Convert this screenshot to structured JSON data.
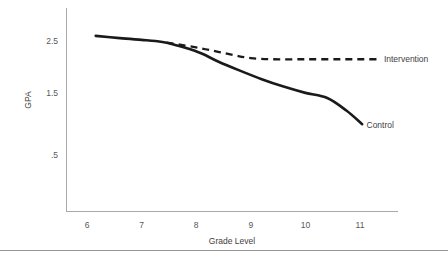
{
  "chart_data": {
    "type": "line",
    "title": "",
    "subtitle": "",
    "xlabel": "Grade Level",
    "ylabel": "GPA",
    "xlim": [
      5.6,
      11.7
    ],
    "ylim": [
      0.0,
      3.0
    ],
    "xticks": [
      "6",
      "7",
      "8",
      "9",
      "10",
      "11"
    ],
    "xtick_values": [
      6,
      7,
      8,
      9,
      10,
      11
    ],
    "yticks": [
      "2.5",
      "1.5",
      ".5"
    ],
    "ytick_values": [
      2.5,
      1.5,
      0.5
    ],
    "grid": false,
    "legend_position": "right-inline-labels",
    "series": [
      {
        "name": "Control",
        "style": "solid",
        "label": "Control",
        "label_x": 11.1,
        "label_y": 1.02,
        "x": [
          6.16,
          6.6,
          7.0,
          7.25,
          7.46,
          7.8,
          8.1,
          8.4,
          8.8,
          9.2,
          9.6,
          10.0,
          10.4,
          10.75,
          11.04
        ],
        "y": [
          2.59,
          2.55,
          2.52,
          2.5,
          2.47,
          2.38,
          2.28,
          2.14,
          1.98,
          1.83,
          1.7,
          1.59,
          1.5,
          1.28,
          1.04
        ]
      },
      {
        "name": "Intervention",
        "style": "dashed",
        "label": "Intervention",
        "label_x": 11.42,
        "label_y": 2.18,
        "x": [
          7.46,
          7.8,
          8.1,
          8.4,
          8.7,
          9.0,
          9.4,
          10.0,
          10.6,
          11.0,
          11.32
        ],
        "y": [
          2.47,
          2.42,
          2.37,
          2.31,
          2.25,
          2.2,
          2.18,
          2.18,
          2.18,
          2.18,
          2.18
        ]
      }
    ]
  },
  "colors": {
    "series_ink": "#1a1a1a",
    "axis": "#a7a9ac",
    "tick_text": "#58595b",
    "title_text": "#414042",
    "background": "#ffffff",
    "footer_rule": "#939598"
  }
}
